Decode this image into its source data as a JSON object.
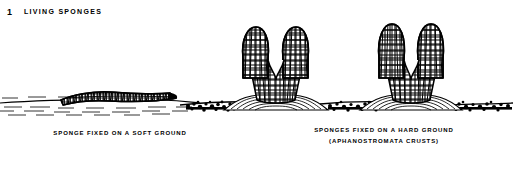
{
  "figure": {
    "number": "1",
    "title": "LIVING SPONGES",
    "caption_left": "SPONGE FIXED ON A SOFT GROUND",
    "caption_right_line1": "SPONGES FIXED ON A HARD GROUND",
    "caption_right_line2": "(APHANOSTROMATA CRUSTS)",
    "ink_color": "#000000",
    "background_color": "#ffffff"
  },
  "scene": {
    "ground_label": "seafloor-substrate",
    "soft_ground_label": "soft-ground",
    "hard_ground_label": "hard-ground",
    "specimens": [
      {
        "name": "reclining-sponge",
        "form": "elongate reclining ribbed tube",
        "substrate": "soft ground"
      },
      {
        "name": "bifurcate-sponge-left",
        "form": "Y-shaped vase with meshwork wall",
        "substrate": "hard ground crust mound"
      },
      {
        "name": "bifurcate-sponge-right",
        "form": "Y-shaped vase with meshwork wall",
        "substrate": "hard ground crust mound"
      }
    ]
  }
}
